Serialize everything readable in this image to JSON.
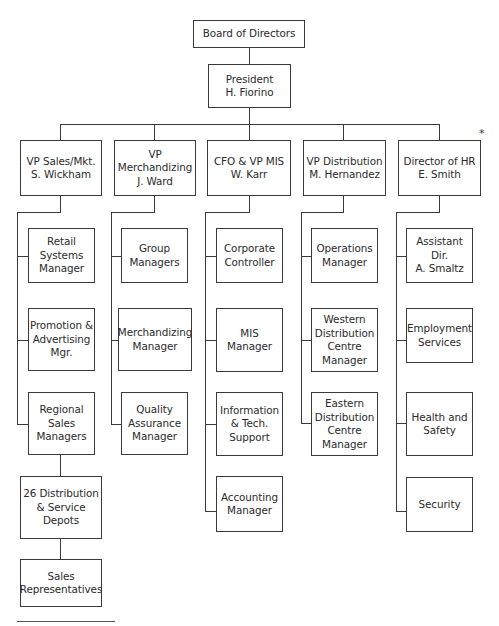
{
  "chart_title": "",
  "top": {
    "board": "Board of Directors",
    "president": "President\nH. Fiorino"
  },
  "columns": [
    {
      "head": "VP Sales/Mkt.\nS. Wickham",
      "reports": [
        "Retail\nSystems\nManager",
        "Promotion &\nAdvertising\nMgr.",
        "Regional\nSales\nManagers"
      ],
      "chain": [
        "26 Distribution\n& Service\nDepots",
        "Sales\nRepresentatives"
      ]
    },
    {
      "head": "VP\nMerchandizing\nJ. Ward",
      "reports": [
        "Group\nManagers",
        "Merchandizing\nManager",
        "Quality\nAssurance\nManager"
      ]
    },
    {
      "head": "CFO & VP MIS\nW. Karr",
      "reports": [
        "Corporate\nController",
        "MIS\nManager",
        "Information\n& Tech.\nSupport",
        "Accounting\nManager"
      ]
    },
    {
      "head": "VP Distribution\nM. Hernandez",
      "reports": [
        "Operations\nManager",
        "Western\nDistribution\nCentre\nManager",
        "Eastern\nDistribution\nCentre\nManager"
      ]
    },
    {
      "head": "Director of HR\nE. Smith",
      "reports": [
        "Assistant Dir.\nA. Smaltz",
        "Employment\nServices",
        "Health and\nSafety",
        "Security"
      ]
    }
  ],
  "annotations": {
    "asterisk": "*"
  }
}
